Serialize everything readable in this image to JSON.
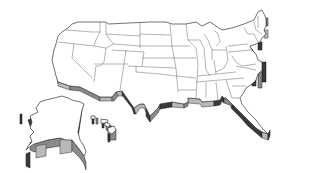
{
  "map": {
    "title": "",
    "style": "3D extruded outline map",
    "region": "United States",
    "parts": [
      "contiguous-us",
      "alaska",
      "hawaii"
    ],
    "colors": {
      "background": "#ffffff",
      "land": "#ffffff",
      "border": "#555555",
      "extrusion_light": "#b8b8b8",
      "extrusion_mid": "#8a8a8a",
      "extrusion_dark": "#3a3a3a"
    }
  }
}
